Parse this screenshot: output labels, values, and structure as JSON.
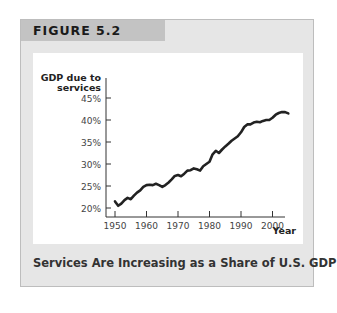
{
  "figure": {
    "label": "FIGURE 5.2",
    "caption": "Services Are Increasing as a Share of U.S. GDP"
  },
  "chart_data": {
    "type": "line",
    "title": "Services Are Increasing as a Share of U.S. GDP",
    "xlabel": "Year",
    "ylabel": "GDP due to services",
    "ylabel_lines": [
      "GDP due to",
      "services"
    ],
    "x_ticks": [
      1950,
      1960,
      1970,
      1980,
      1990,
      2000
    ],
    "y_ticks": [
      "20%",
      "25%",
      "30%",
      "35%",
      "40%",
      "45%"
    ],
    "y_tick_values": [
      20,
      25,
      30,
      35,
      40,
      45
    ],
    "xlim": [
      1949,
      2006
    ],
    "ylim": [
      19,
      46
    ],
    "grid": false,
    "legend": "none",
    "series": [
      {
        "name": "GDP due to services (%)",
        "color": "#222222",
        "x": [
          1950,
          1951,
          1952,
          1953,
          1954,
          1955,
          1956,
          1957,
          1958,
          1959,
          1960,
          1961,
          1962,
          1963,
          1964,
          1965,
          1966,
          1967,
          1968,
          1969,
          1970,
          1971,
          1972,
          1973,
          1974,
          1975,
          1976,
          1977,
          1978,
          1979,
          1980,
          1981,
          1982,
          1983,
          1984,
          1985,
          1986,
          1987,
          1988,
          1989,
          1990,
          1991,
          1992,
          1993,
          1994,
          1995,
          1996,
          1997,
          1998,
          1999,
          2000,
          2001,
          2002,
          2003,
          2004,
          2005
        ],
        "values": [
          21.5,
          20.5,
          21.0,
          21.8,
          22.3,
          22.0,
          22.8,
          23.5,
          24.0,
          24.8,
          25.2,
          25.3,
          25.2,
          25.5,
          25.2,
          24.8,
          25.2,
          25.8,
          26.5,
          27.3,
          27.5,
          27.2,
          27.8,
          28.5,
          28.6,
          29.0,
          28.8,
          28.5,
          29.5,
          30.0,
          30.5,
          32.2,
          33.0,
          32.5,
          33.3,
          34.0,
          34.6,
          35.3,
          35.8,
          36.3,
          37.2,
          38.4,
          39.0,
          39.0,
          39.4,
          39.6,
          39.5,
          39.8,
          40.0,
          40.0,
          40.5,
          41.2,
          41.6,
          41.8,
          41.8,
          41.5
        ]
      }
    ]
  }
}
